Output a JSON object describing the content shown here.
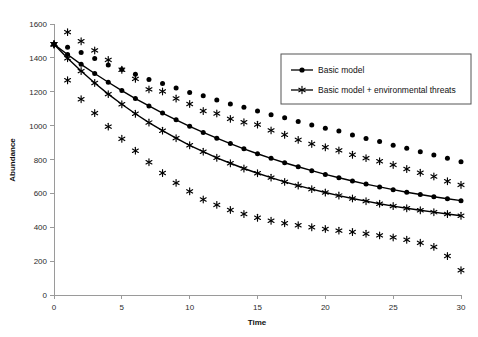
{
  "chart_data": {
    "type": "scatter",
    "title": "",
    "xlabel": "Time",
    "ylabel": "Abundance",
    "xlim": [
      0,
      30
    ],
    "ylim": [
      0,
      1600
    ],
    "xticks": [
      0,
      5,
      10,
      15,
      20,
      25,
      30
    ],
    "yticks": [
      0,
      200,
      400,
      600,
      800,
      1000,
      1200,
      1400,
      1600
    ],
    "grid": false,
    "legend_position": "top-right",
    "legend": [
      "Basic model",
      "Basic model + environmental threats"
    ],
    "x": [
      0,
      1,
      2,
      3,
      4,
      5,
      6,
      7,
      8,
      9,
      10,
      11,
      12,
      13,
      14,
      15,
      16,
      17,
      18,
      19,
      20,
      21,
      22,
      23,
      24,
      25,
      26,
      27,
      28,
      29,
      30
    ],
    "series": [
      {
        "name": "Basic model",
        "marker": "circle",
        "role": "fitted-curve",
        "values": [
          1480,
          1420,
          1362,
          1308,
          1256,
          1207,
          1160,
          1116,
          1074,
          1034,
          996,
          960,
          926,
          894,
          863,
          834,
          807,
          781,
          757,
          734,
          712,
          692,
          673,
          655,
          638,
          622,
          607,
          593,
          580,
          568,
          557
        ]
      },
      {
        "name": "Basic model",
        "marker": "circle",
        "role": "observed-upper",
        "values": [
          1480,
          1462,
          1432,
          1396,
          1358,
          1332,
          1304,
          1272,
          1248,
          1222,
          1196,
          1176,
          1152,
          1128,
          1108,
          1086,
          1064,
          1046,
          1024,
          1004,
          984,
          968,
          944,
          924,
          906,
          884,
          866,
          846,
          826,
          808,
          786
        ]
      },
      {
        "name": "Basic model + environmental threats",
        "marker": "asterisk",
        "role": "fitted-curve",
        "values": [
          1480,
          1398,
          1322,
          1252,
          1186,
          1126,
          1070,
          1018,
          970,
          926,
          884,
          846,
          810,
          778,
          747,
          719,
          693,
          668,
          646,
          625,
          605,
          587,
          570,
          554,
          539,
          525,
          512,
          500,
          489,
          478,
          468
        ]
      },
      {
        "name": "Basic model + environmental threats",
        "marker": "asterisk",
        "role": "observed-upper",
        "values": [
          1480,
          1552,
          1498,
          1444,
          1388,
          1330,
          1276,
          1214,
          1202,
          1160,
          1128,
          1086,
          1072,
          1040,
          1020,
          1006,
          972,
          946,
          916,
          892,
          872,
          854,
          828,
          808,
          790,
          768,
          744,
          722,
          700,
          672,
          650
        ]
      },
      {
        "name": "Basic model + environmental threats",
        "marker": "asterisk",
        "role": "observed-lower",
        "values": [
          1480,
          1268,
          1156,
          1074,
          994,
          922,
          852,
          784,
          720,
          662,
          612,
          564,
          532,
          502,
          478,
          456,
          438,
          424,
          412,
          400,
          390,
          380,
          372,
          362,
          352,
          340,
          326,
          308,
          284,
          230,
          146
        ]
      }
    ]
  }
}
